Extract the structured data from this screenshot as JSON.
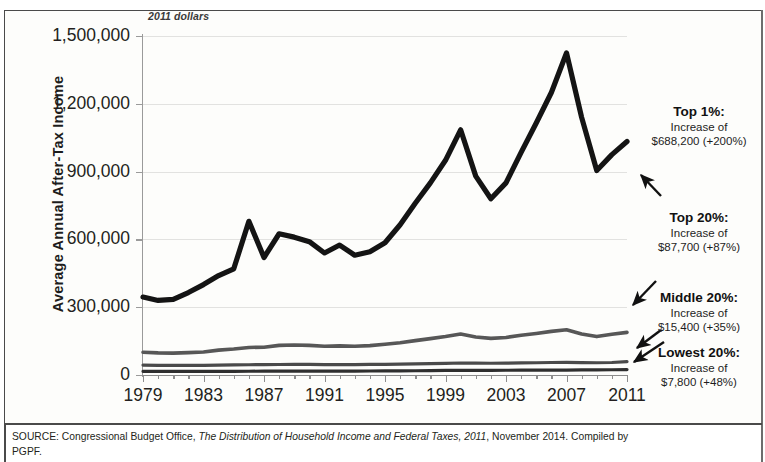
{
  "chart_data": {
    "type": "line",
    "title": "",
    "subtitle": "2011 dollars",
    "ylabel": "Average Annual After-Tax Income",
    "xlabel": "",
    "xlim": [
      1979,
      2011
    ],
    "ylim": [
      0,
      1500000
    ],
    "grid": true,
    "legend_position": "right-annotations",
    "x": [
      1979,
      1980,
      1981,
      1982,
      1983,
      1984,
      1985,
      1986,
      1987,
      1988,
      1989,
      1990,
      1991,
      1992,
      1993,
      1994,
      1995,
      1996,
      1997,
      1998,
      1999,
      2000,
      2001,
      2002,
      2003,
      2004,
      2005,
      2006,
      2007,
      2008,
      2009,
      2010,
      2011
    ],
    "xticks": [
      "1979",
      "1983",
      "1987",
      "1991",
      "1995",
      "1999",
      "2003",
      "2007",
      "2011"
    ],
    "yticks": [
      "0",
      "300,000",
      "600,000",
      "900,000",
      "1,200,000",
      "1,500,000"
    ],
    "series": [
      {
        "name": "Top 1%",
        "color": "#141414",
        "width": 5.2,
        "values": [
          345000,
          330000,
          335000,
          365000,
          400000,
          440000,
          470000,
          680000,
          520000,
          625000,
          610000,
          590000,
          540000,
          575000,
          530000,
          545000,
          585000,
          665000,
          760000,
          850000,
          950000,
          1085000,
          880000,
          780000,
          850000,
          985000,
          1115000,
          1250000,
          1425000,
          1140000,
          905000,
          975000,
          1033200
        ]
      },
      {
        "name": "Top 20%",
        "color": "#575757",
        "width": 3.6,
        "values": [
          100800,
          98000,
          97000,
          99000,
          102000,
          110000,
          115000,
          122000,
          123000,
          131000,
          133000,
          131000,
          127000,
          129000,
          127000,
          130000,
          136000,
          143000,
          152000,
          161000,
          170000,
          181000,
          168000,
          162000,
          166000,
          176000,
          184000,
          193000,
          200000,
          181000,
          170000,
          180000,
          188500
        ]
      },
      {
        "name": "Middle 20%",
        "color": "#4a4a4a",
        "width": 3.2,
        "values": [
          44000,
          43000,
          42500,
          42200,
          42500,
          43800,
          44500,
          45300,
          45800,
          46500,
          47000,
          46800,
          46000,
          46300,
          46100,
          46600,
          47200,
          47900,
          49000,
          50500,
          51800,
          53000,
          52300,
          52000,
          52600,
          53600,
          54200,
          55200,
          56300,
          55000,
          54200,
          55400,
          59400
        ]
      },
      {
        "name": "Lowest 20%",
        "color": "#2f2f2f",
        "width": 3.2,
        "values": [
          16200,
          16000,
          15700,
          15600,
          15700,
          16100,
          16300,
          16600,
          16900,
          17200,
          17500,
          17400,
          17200,
          17400,
          17500,
          17800,
          18100,
          18400,
          18900,
          19500,
          20100,
          20600,
          20700,
          20900,
          21000,
          21200,
          21300,
          21600,
          21900,
          22300,
          22600,
          23200,
          24000
        ]
      }
    ],
    "annotations": [
      {
        "id": "top1",
        "heading": "Top 1%:",
        "line1": "Increase of",
        "line2": "$688,200 (+200%)",
        "target_series": "Top 1%"
      },
      {
        "id": "top20",
        "heading": "Top 20%:",
        "line1": "Increase of",
        "line2": "$87,700 (+87%)",
        "target_series": "Top 20%"
      },
      {
        "id": "mid20",
        "heading": "Middle 20%:",
        "line1": "Increase of",
        "line2": "$15,400 (+35%)",
        "target_series": "Middle 20%"
      },
      {
        "id": "low20",
        "heading": "Lowest 20%:",
        "line1": "Increase of",
        "line2": "$7,800 (+48%)",
        "target_series": "Lowest 20%"
      }
    ]
  },
  "source": {
    "prefix": "SOURCE: Congressional Budget Office, ",
    "report": "The Distribution of Household Income and Federal Taxes, 2011",
    "suffix": ", November 2014. Compiled by",
    "line2": "PGPF."
  },
  "axis": {
    "ytick_0": "0",
    "ytick_1": "300,000",
    "ytick_2": "600,000",
    "ytick_3": "900,000",
    "ytick_4": "1,200,000",
    "ytick_5": "1,500,000",
    "xtick_0": "1979",
    "xtick_1": "1983",
    "xtick_2": "1987",
    "xtick_3": "1991",
    "xtick_4": "1995",
    "xtick_5": "1999",
    "xtick_6": "2003",
    "xtick_7": "2007",
    "xtick_8": "2011"
  }
}
